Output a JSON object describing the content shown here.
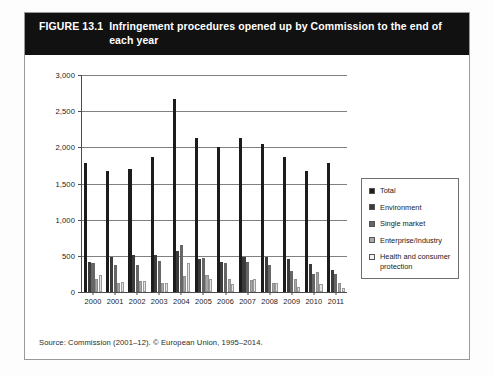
{
  "figure": {
    "number_label": "FIGURE 13.1",
    "title": "Infringement procedures opened up by Commission to the end of each year",
    "source": "Source: Commission (2001–12). © European Union, 1995–2014."
  },
  "legend": {
    "position": "right",
    "items": [
      {
        "label": "Total",
        "color": "#1c1c1c"
      },
      {
        "label": "Environment",
        "color": "#3b3b3b"
      },
      {
        "label": "Single market",
        "color": "#666666"
      },
      {
        "label": "Enterprise/Industry",
        "color": "#a8a8a8"
      },
      {
        "label": "Health and consumer protection",
        "color": "#f2f2f2"
      }
    ]
  },
  "axis": {
    "y_ticks": [
      "0",
      "500",
      "1,000",
      "1,500",
      "2,000",
      "2,500",
      "3,000"
    ],
    "x_ticks": [
      "2000",
      "2001",
      "2002",
      "2003",
      "2004",
      "2005",
      "2006",
      "2007",
      "2008",
      "2009",
      "2010",
      "2011"
    ]
  },
  "chart_data": {
    "type": "bar",
    "title": "Infringement procedures opened up by Commission to the end of each year",
    "xlabel": "",
    "ylabel": "",
    "ylim": [
      0,
      3000
    ],
    "ytick_step": 500,
    "grid": true,
    "legend_position": "right",
    "categories": [
      "2000",
      "2001",
      "2002",
      "2003",
      "2004",
      "2005",
      "2006",
      "2007",
      "2008",
      "2009",
      "2010",
      "2011"
    ],
    "series": [
      {
        "name": "Total",
        "color": "#1c1c1c",
        "values": [
          1780,
          1670,
          1705,
          1860,
          2670,
          2130,
          2010,
          2130,
          2045,
          1860,
          1670,
          1780
        ]
      },
      {
        "name": "Environment",
        "color": "#3b3b3b",
        "values": [
          410,
          490,
          510,
          510,
          570,
          450,
          415,
          490,
          490,
          460,
          390,
          300
        ]
      },
      {
        "name": "Single market",
        "color": "#666666",
        "values": [
          400,
          370,
          380,
          430,
          645,
          465,
          400,
          420,
          370,
          290,
          245,
          245
        ]
      },
      {
        "name": "Enterprise/Industry",
        "color": "#a8a8a8",
        "values": [
          185,
          130,
          150,
          125,
          225,
          240,
          180,
          160,
          130,
          180,
          275,
          120
        ]
      },
      {
        "name": "Health and consumer protection",
        "color": "#f2f2f2",
        "values": [
          235,
          145,
          155,
          130,
          405,
          180,
          105,
          180,
          125,
          75,
          110,
          50
        ]
      }
    ]
  }
}
